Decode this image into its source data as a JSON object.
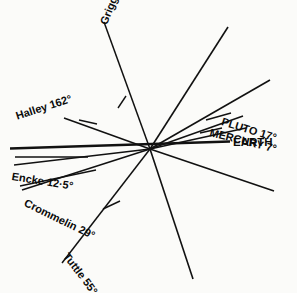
{
  "figure": {
    "center": {
      "x": 150,
      "y": 149
    },
    "background_color": "#fbfbf9",
    "line_color": "#111111",
    "text_color": "#0b0b0b"
  },
  "chart_data": {
    "type": "line",
    "xlabel": "",
    "ylabel": "",
    "reference": "EARTH",
    "categories": [
      "EARTH",
      "MERCURY 7°",
      "PLUTO 17°",
      "Encke 12·5°",
      "Crommelin 29°",
      "Tuttle 55°",
      "Grigg–Mellish 110°",
      "Halley 162°"
    ],
    "values": [
      0,
      7,
      17,
      12.5,
      29,
      55,
      110,
      162
    ],
    "units": "degrees",
    "series": [
      {
        "name": "inclination",
        "values": [
          0,
          7,
          17,
          12.5,
          29,
          55,
          110,
          162
        ]
      }
    ]
  },
  "rays": [
    {
      "id": "earth",
      "label": "EARTH",
      "inclination": 0,
      "x1": 10,
      "y1": 148.5,
      "x2": 230,
      "y2": 141.5,
      "width": 2.6
    },
    {
      "id": "mercury",
      "label": "MERCURY 7°",
      "inclination": 7,
      "x1": 150,
      "y1": 149,
      "x2": 246,
      "y2": 128,
      "width": 1.5
    },
    {
      "id": "pluto",
      "label": "PLUTO 17°",
      "inclination": 17,
      "x1": 150,
      "y1": 149,
      "x2": 243,
      "y2": 116,
      "width": 1.5
    },
    {
      "id": "encke",
      "label": "Encke 12·5°",
      "inclination": 12.5,
      "x1": 150,
      "y1": 149,
      "x2": 14,
      "y2": 165,
      "width": 1.5
    },
    {
      "id": "crommelin",
      "label": "Crommelin 29°",
      "inclination": 29,
      "x1": 150,
      "y1": 149,
      "x2": 22,
      "y2": 190,
      "width": 1.5
    },
    {
      "id": "tuttle",
      "label": "Tuttle 55°",
      "inclination": 55,
      "x1": 150,
      "y1": 149,
      "x2": 62,
      "y2": 263,
      "width": 1.5
    },
    {
      "id": "grigg-mellish",
      "label": "Grigg–Mellish 110°",
      "inclination": 110,
      "x1": 150,
      "y1": 149,
      "x2": 104,
      "y2": 22,
      "width": 1.5
    },
    {
      "id": "halley",
      "label": "Halley 162°",
      "inclination": 162,
      "x1": 150,
      "y1": 149,
      "x2": 64,
      "y2": 118,
      "width": 1.5
    },
    {
      "id": "pluto-opposite",
      "label": "",
      "inclination": 17,
      "x1": 150,
      "y1": 149,
      "x2": 274,
      "y2": 191,
      "width": 1.6
    },
    {
      "id": "mercury-upper-branch",
      "label": "",
      "inclination": 7,
      "x1": 150,
      "y1": 149,
      "x2": 270,
      "y2": 80,
      "width": 1.6
    },
    {
      "id": "tuttle-opposite",
      "label": "",
      "inclination": 55,
      "x1": 150,
      "y1": 149,
      "x2": 228,
      "y2": 27,
      "width": 1.6
    },
    {
      "id": "grigg-mellish-opposite",
      "label": "",
      "inclination": 110,
      "x1": 150,
      "y1": 149,
      "x2": 193,
      "y2": 279,
      "width": 1.6
    }
  ],
  "leaders": [
    {
      "id": "pluto-leader",
      "x1": 206,
      "y1": 120,
      "x2": 231,
      "y2": 113
    },
    {
      "id": "mercury-leader",
      "x1": 200,
      "y1": 133,
      "x2": 222,
      "y2": 128
    },
    {
      "id": "halley-leader",
      "x1": 79,
      "y1": 120,
      "x2": 97,
      "y2": 124
    },
    {
      "id": "encke-leader",
      "x1": 15,
      "y1": 157,
      "x2": 88,
      "y2": 157
    },
    {
      "id": "crommelin-leader",
      "x1": 20,
      "y1": 186,
      "x2": 96,
      "y2": 170
    },
    {
      "id": "tuttle-leader",
      "x1": 103,
      "y1": 209,
      "x2": 120,
      "y2": 201
    },
    {
      "id": "grigg-leader",
      "x1": 118,
      "y1": 108,
      "x2": 126,
      "y2": 96
    }
  ],
  "labels": {
    "earth": {
      "text": "EARTH",
      "x": 233,
      "y": 136,
      "rotate": 0,
      "size": 11.5,
      "weight": 700
    },
    "mercury": {
      "text": "MERCURY 7°",
      "x": 210,
      "y": 126,
      "rotate": -14,
      "size": 11,
      "weight": 700
    },
    "pluto": {
      "text": "PLUTO 17°",
      "x": 222,
      "y": 115,
      "rotate": -17,
      "size": 11,
      "weight": 700
    },
    "halley": {
      "text": "Halley 162°",
      "x": 16,
      "y": 110,
      "rotate": 18,
      "size": 11,
      "weight": 700
    },
    "grigg_mellish": {
      "text": "Grigg–Mellish 110°",
      "x": 103,
      "y": 18,
      "rotate": 68,
      "size": 11,
      "weight": 700
    },
    "encke": {
      "text": "Encke 12·5°",
      "x": 12,
      "y": 170,
      "rotate": -9,
      "size": 11,
      "weight": 700
    },
    "crommelin": {
      "text": "Crommelin 29°",
      "x": 25,
      "y": 196,
      "rotate": -26,
      "size": 11,
      "weight": 700
    },
    "tuttle": {
      "text": "Tuttle 55°",
      "x": 66,
      "y": 248,
      "rotate": -53,
      "size": 11,
      "weight": 700
    }
  }
}
